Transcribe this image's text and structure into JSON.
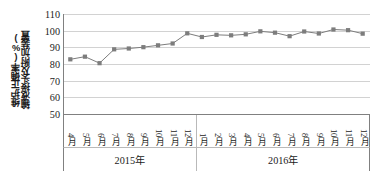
{
  "chart_data": {
    "type": "line",
    "title": "",
    "subtitle": "",
    "xlabel": "",
    "ylabel": "输液接头及附加装置维护正确率(%)",
    "ylabel_lines": [
      "输液接头及附加装置",
      "维护正确率(%)"
    ],
    "ylim": [
      50,
      110
    ],
    "ytick_step": 10,
    "yticks": [
      "110",
      "100",
      "90",
      "80",
      "70",
      "60",
      "50"
    ],
    "grid": true,
    "legend": "none",
    "marker": "square",
    "series_color": "#7d7d7d",
    "grid_color": "#d2d2d2",
    "axis_color": "#808080",
    "categories": [
      "4月",
      "5月",
      "6月",
      "7月",
      "8月",
      "9月",
      "10月",
      "11月",
      "12月",
      "1月",
      "2月",
      "3月",
      "4月",
      "5月",
      "6月",
      "7月",
      "8月",
      "9月",
      "10月",
      "11月",
      "12月"
    ],
    "values": [
      82.8,
      84.4,
      80.5,
      88.8,
      89.3,
      90.1,
      91.2,
      92.3,
      98.4,
      96.2,
      97.5,
      97.2,
      97.8,
      99.6,
      98.8,
      96.7,
      99.5,
      98.3,
      100.7,
      100.3,
      98.2
    ],
    "groups": [
      {
        "label": "2015年",
        "count": 9
      },
      {
        "label": "2016年",
        "count": 12
      }
    ]
  }
}
